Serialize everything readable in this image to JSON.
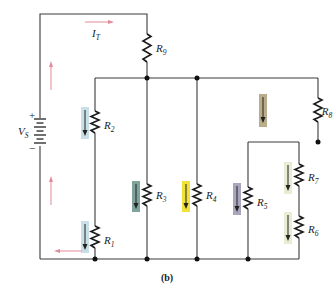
{
  "figure": {
    "caption": "(b)",
    "source": {
      "symbol": "V",
      "subscript": "S",
      "plus": "+",
      "minus": "−"
    },
    "total_current": {
      "symbol": "I",
      "subscript": "T"
    },
    "resistors": [
      {
        "id": "R1",
        "symbol": "R",
        "subscript": "1",
        "highlight": "#c9dfe8"
      },
      {
        "id": "R2",
        "symbol": "R",
        "subscript": "2",
        "highlight": "#c9dfe8"
      },
      {
        "id": "R3",
        "symbol": "R",
        "subscript": "3",
        "highlight": "#7fa39a"
      },
      {
        "id": "R4",
        "symbol": "R",
        "subscript": "4",
        "highlight": "#f1e23a"
      },
      {
        "id": "R5",
        "symbol": "R",
        "subscript": "5",
        "highlight": "#a8a6bd"
      },
      {
        "id": "R6",
        "symbol": "R",
        "subscript": "6",
        "highlight": "#e8ecd2"
      },
      {
        "id": "R7",
        "symbol": "R",
        "subscript": "7",
        "highlight": "#e8ecd2"
      },
      {
        "id": "R8",
        "symbol": "R",
        "subscript": "8",
        "highlight": "#b9ad8c"
      },
      {
        "id": "R9",
        "symbol": "R",
        "subscript": "9",
        "highlight": null
      }
    ],
    "colors": {
      "wire": "#3a3a3a",
      "conventional_current_arrows": "#e48a9a",
      "branch_current_arrows": "#222222"
    }
  }
}
